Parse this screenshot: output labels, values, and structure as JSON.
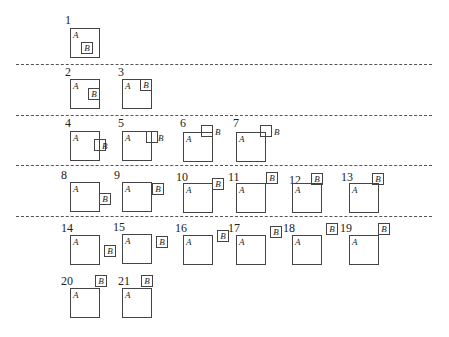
{
  "figure": {
    "labels": {
      "a": "A",
      "b": "B"
    },
    "separators_y": [
      64,
      115,
      165,
      216
    ],
    "cases": [
      {
        "n": "1",
        "num": [
          65,
          14
        ],
        "A": [
          70,
          28,
          30,
          30
        ],
        "B": [
          81,
          42
        ],
        "b_inside": true
      },
      {
        "n": "2",
        "num": [
          65,
          66
        ],
        "A": [
          70,
          79,
          30,
          30
        ],
        "B": [
          88,
          88
        ],
        "b_inside": true
      },
      {
        "n": "3",
        "num": [
          118,
          66
        ],
        "A": [
          122,
          79,
          30,
          30
        ],
        "B": [
          140,
          79
        ],
        "b_inside": true
      },
      {
        "n": "4",
        "num": [
          65,
          117
        ],
        "A": [
          70,
          131,
          30,
          30
        ],
        "B": [
          94,
          139
        ],
        "b_inside": false,
        "b_side": [
          102,
          142
        ]
      },
      {
        "n": "5",
        "num": [
          118,
          117
        ],
        "A": [
          122,
          131,
          30,
          30
        ],
        "B": [
          146,
          131
        ],
        "b_inside": false,
        "b_side": [
          158,
          134
        ]
      },
      {
        "n": "6",
        "num": [
          180,
          117
        ],
        "A": [
          183,
          132,
          30,
          30
        ],
        "B": [
          201,
          125
        ],
        "b_inside": false,
        "b_side": [
          215,
          128
        ]
      },
      {
        "n": "7",
        "num": [
          233,
          117
        ],
        "A": [
          236,
          132,
          30,
          30
        ],
        "B": [
          260,
          125
        ],
        "b_inside": false,
        "b_side": [
          274,
          128
        ]
      },
      {
        "n": "8",
        "num": [
          61,
          169
        ],
        "A": [
          70,
          182,
          30,
          30
        ],
        "B": [
          99,
          193
        ],
        "b_inside": true
      },
      {
        "n": "9",
        "num": [
          114,
          169
        ],
        "A": [
          122,
          182,
          30,
          30
        ],
        "B": [
          152,
          183
        ],
        "b_inside": true
      },
      {
        "n": "10",
        "num": [
          176,
          171
        ],
        "A": [
          183,
          183,
          30,
          30
        ],
        "B": [
          212,
          178
        ],
        "b_inside": true
      },
      {
        "n": "11",
        "num": [
          228,
          171
        ],
        "A": [
          236,
          183,
          30,
          30
        ],
        "B": [
          266,
          172
        ],
        "b_inside": true
      },
      {
        "n": "12",
        "num": [
          289,
          174
        ],
        "A": [
          292,
          183,
          30,
          30
        ],
        "B": [
          311,
          173
        ],
        "b_inside": true
      },
      {
        "n": "13",
        "num": [
          341,
          171
        ],
        "A": [
          349,
          183,
          30,
          30
        ],
        "B": [
          372,
          173
        ],
        "b_inside": true
      },
      {
        "n": "14",
        "num": [
          61,
          222
        ],
        "A": [
          70,
          235,
          30,
          30
        ],
        "B": [
          104,
          245
        ],
        "b_inside": true
      },
      {
        "n": "15",
        "num": [
          113,
          221
        ],
        "A": [
          122,
          234,
          30,
          30
        ],
        "B": [
          156,
          236
        ],
        "b_inside": true
      },
      {
        "n": "16",
        "num": [
          175,
          222
        ],
        "A": [
          183,
          235,
          30,
          30
        ],
        "B": [
          217,
          230
        ],
        "b_inside": true
      },
      {
        "n": "17",
        "num": [
          228,
          222
        ],
        "A": [
          236,
          235,
          30,
          30
        ],
        "B": [
          270,
          226
        ],
        "b_inside": true
      },
      {
        "n": "18",
        "num": [
          283,
          222
        ],
        "A": [
          292,
          235,
          30,
          30
        ],
        "B": [
          326,
          223
        ],
        "b_inside": true
      },
      {
        "n": "19",
        "num": [
          340,
          222
        ],
        "A": [
          349,
          235,
          30,
          30
        ],
        "B": [
          378,
          223
        ],
        "b_inside": true
      },
      {
        "n": "20",
        "num": [
          61,
          275
        ],
        "A": [
          70,
          288,
          30,
          30
        ],
        "B": [
          95,
          275
        ],
        "b_inside": true
      },
      {
        "n": "21",
        "num": [
          118,
          275
        ],
        "A": [
          122,
          288,
          30,
          30
        ],
        "B": [
          141,
          275
        ],
        "b_inside": true
      }
    ]
  }
}
